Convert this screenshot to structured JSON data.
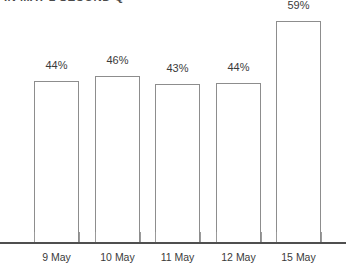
{
  "chart_data": {
    "type": "bar",
    "title": "IN MAY 2 SECOND Q",
    "subtitle": "",
    "xlabel": "",
    "ylabel": "",
    "categories": [
      "9 May",
      "10 May",
      "11 May",
      "12 May",
      "15 May"
    ],
    "values": [
      44,
      46,
      43,
      44,
      59
    ],
    "value_labels": [
      "44%",
      "46%",
      "43%",
      "44%",
      "59%"
    ],
    "unit": "%",
    "ylim": [
      0,
      75
    ],
    "grid": false,
    "legend": false,
    "legend_position": "none",
    "series": [
      {
        "name": "",
        "values": [
          44,
          46,
          43,
          44,
          59
        ]
      }
    ],
    "style": {
      "bar_fill": "#ffffff",
      "bar_border": "#8d8d8d",
      "axis_color": "#4f4f4f",
      "text_color": "#3b3b3b",
      "background": "#ffffff"
    }
  },
  "bars": [
    {
      "label": "9 May",
      "value_label": "44%",
      "left": 34,
      "width": 45,
      "top": 81,
      "height": 162,
      "label_left": 34,
      "label_top": 59,
      "tick_left": 34
    },
    {
      "label": "10 May",
      "value_label": "46%",
      "left": 95,
      "width": 45,
      "top": 76,
      "height": 167,
      "label_left": 95,
      "label_top": 54,
      "tick_left": 95
    },
    {
      "label": "11 May",
      "value_label": "43%",
      "left": 155,
      "width": 45,
      "top": 84,
      "height": 159,
      "label_left": 155,
      "label_top": 62,
      "tick_left": 155
    },
    {
      "label": "12 May",
      "value_label": "44%",
      "left": 216,
      "width": 45,
      "top": 83,
      "height": 160,
      "label_left": 216,
      "label_top": 61,
      "tick_left": 216
    },
    {
      "label": "15 May",
      "value_label": "59%",
      "left": 276,
      "width": 45,
      "top": 21,
      "height": 222,
      "label_left": 276,
      "label_top": -1,
      "tick_left": 276
    }
  ],
  "ticks": [
    {
      "left": 79,
      "top": 232,
      "height": 11
    },
    {
      "left": 140,
      "top": 232,
      "height": 11
    },
    {
      "left": 200,
      "top": 232,
      "height": 11
    },
    {
      "left": 261,
      "top": 232,
      "height": 11
    },
    {
      "left": 321,
      "top": 232,
      "height": 11
    }
  ]
}
